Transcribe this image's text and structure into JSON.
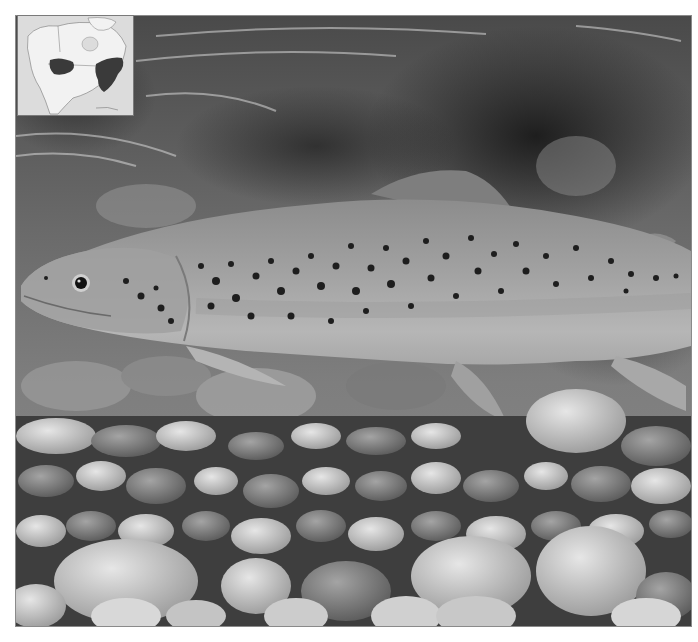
{
  "image": {
    "subject": "trout-over-gravel",
    "palette": {
      "water_dark": "#2e2e2e",
      "water_mid": "#6e6e6e",
      "fish_body": "#9a9a9a",
      "fish_belly": "#b8b8b8",
      "spots": "#1e1e1e",
      "stones_light": "#d4d4d4",
      "stones_mid": "#9c9c9c",
      "stones_dark": "#5c5c5c"
    }
  },
  "inset_map": {
    "region": "north-america",
    "range_color": "#3a3a3a",
    "land_color": "#f0f0f0",
    "water_color": "#d8d8d8"
  }
}
